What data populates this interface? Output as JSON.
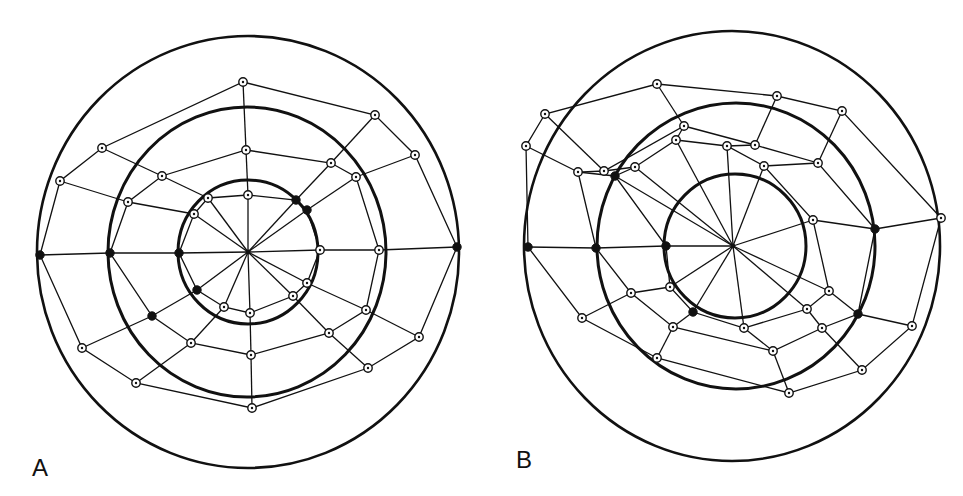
{
  "figure": {
    "width": 963,
    "height": 496,
    "ink_color": "#111111",
    "background": "#ffffff"
  },
  "panels": [
    {
      "id": "A",
      "label": "A",
      "label_pos": [
        40,
        480
      ],
      "hub": [
        248,
        252
      ],
      "rings": [
        {
          "name": "outer",
          "cx": 248,
          "cy": 252,
          "rx": 211,
          "ry": 216
        },
        {
          "name": "middle",
          "cx": 247,
          "cy": 252,
          "rx": 139,
          "ry": 145
        },
        {
          "name": "inner",
          "cx": 248,
          "cy": 252,
          "rx": 70,
          "ry": 72
        }
      ],
      "nodes": {
        "outer": [
          [
            243,
            82
          ],
          [
            375,
            115
          ],
          [
            415,
            155
          ],
          [
            457,
            247
          ],
          [
            419,
            337
          ],
          [
            368,
            368
          ],
          [
            252,
            408
          ],
          [
            136,
            383
          ],
          [
            82,
            348
          ],
          [
            40,
            255
          ],
          [
            60,
            181
          ],
          [
            102,
            148
          ]
        ],
        "middle": [
          [
            246,
            150
          ],
          [
            331,
            163
          ],
          [
            356,
            177
          ],
          [
            379,
            250
          ],
          [
            366,
            310
          ],
          [
            329,
            333
          ],
          [
            251,
            355
          ],
          [
            191,
            343
          ],
          [
            152,
            316
          ],
          [
            110,
            253
          ],
          [
            128,
            202
          ],
          [
            162,
            176
          ]
        ],
        "inner": [
          [
            248,
            195
          ],
          [
            296,
            200
          ],
          [
            307,
            210
          ],
          [
            320,
            250
          ],
          [
            307,
            283
          ],
          [
            293,
            296
          ],
          [
            250,
            313
          ],
          [
            224,
            307
          ],
          [
            197,
            290
          ],
          [
            179,
            253
          ],
          [
            194,
            214
          ],
          [
            208,
            198
          ]
        ]
      },
      "filled_nodes": {
        "outer": [
          3,
          9
        ],
        "middle": [
          8,
          9
        ],
        "inner": [
          1,
          2,
          8,
          9
        ]
      }
    },
    {
      "id": "B",
      "label": "B",
      "label_pos": [
        524,
        472
      ],
      "hub": [
        733,
        246
      ],
      "rings": [
        {
          "name": "outer",
          "cx": 732,
          "cy": 246,
          "rx": 208,
          "ry": 215
        },
        {
          "name": "middle",
          "cx": 736,
          "cy": 246,
          "rx": 139,
          "ry": 143
        },
        {
          "name": "inner",
          "cx": 735,
          "cy": 246,
          "rx": 71,
          "ry": 72
        }
      ],
      "nodes": {
        "outer": [
          [
            657,
            84
          ],
          [
            777,
            96
          ],
          [
            842,
            111
          ],
          [
            941,
            218
          ],
          [
            912,
            326
          ],
          [
            862,
            370
          ],
          [
            789,
            393
          ],
          [
            657,
            358
          ],
          [
            582,
            318
          ],
          [
            528,
            247
          ],
          [
            526,
            146
          ],
          [
            545,
            114
          ]
        ],
        "middle": [
          [
            684,
            126
          ],
          [
            755,
            145
          ],
          [
            818,
            163
          ],
          [
            875,
            229
          ],
          [
            858,
            314
          ],
          [
            822,
            328
          ],
          [
            773,
            351
          ],
          [
            673,
            327
          ],
          [
            631,
            293
          ],
          [
            596,
            248
          ],
          [
            578,
            172
          ],
          [
            604,
            171
          ]
        ],
        "inner": [
          [
            676,
            140
          ],
          [
            727,
            146
          ],
          [
            764,
            166
          ],
          [
            813,
            220
          ],
          [
            829,
            291
          ],
          [
            807,
            309
          ],
          [
            744,
            328
          ],
          [
            693,
            312
          ],
          [
            670,
            287
          ],
          [
            666,
            246
          ],
          [
            615,
            176
          ],
          [
            635,
            167
          ]
        ]
      },
      "filled_nodes": {
        "outer": [
          9
        ],
        "middle": [
          3,
          4,
          9
        ],
        "inner": [
          7,
          9,
          10
        ]
      }
    }
  ]
}
